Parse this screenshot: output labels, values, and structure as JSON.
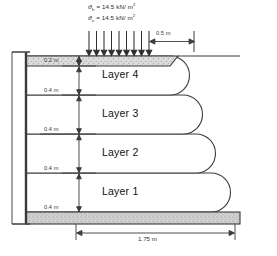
{
  "figure": {
    "surcharge": {
      "line1": {
        "symbol": "σ",
        "subscript": "h",
        "equals": "=",
        "value": "14.5",
        "unit": "kN/ m",
        "exponent": "2",
        "full": "σh = 14.5 kN/m2"
      },
      "line2": {
        "symbol": "σ",
        "subscript": "v",
        "equals": "=",
        "value": "14.5",
        "unit": "kN/ m",
        "exponent": "2",
        "full": "σv = 14.5 kN/m2"
      },
      "arrow_count": 9
    },
    "dimensions": {
      "top_offset": "0.5 m",
      "cap_thickness": "0.2 m",
      "layer_thickness_4": "0.4 m",
      "layer_thickness_3": "0.4 m",
      "layer_thickness_2": "0.4 m",
      "layer_thickness_1": "0.4 m",
      "base_width": "1.75 m"
    },
    "layers": [
      {
        "id": "layer-4",
        "label": "Layer 4"
      },
      {
        "id": "layer-3",
        "label": "Layer 3"
      },
      {
        "id": "layer-2",
        "label": "Layer 2"
      },
      {
        "id": "layer-1",
        "label": "Layer 1"
      }
    ],
    "colors": {
      "line": "#3a3a3a",
      "fill": "#ffffff",
      "hatch_fill": "#c9c9c9",
      "foundation_fill": "#d0d0d0",
      "text": "#1a1a1a",
      "background": "#ffffff"
    }
  }
}
